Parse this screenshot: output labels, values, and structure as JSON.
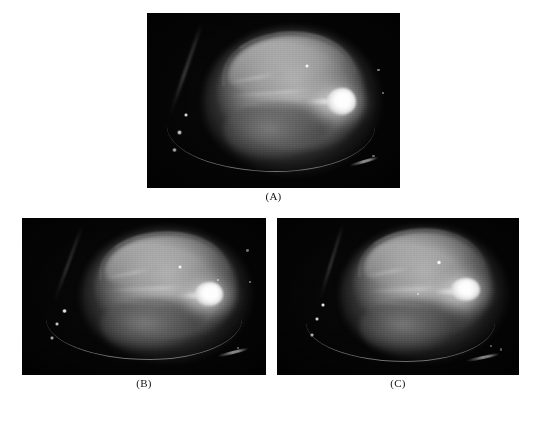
{
  "figure": {
    "background_color": "#ffffff",
    "panel_background_color": "#050505",
    "caption_color": "#141414",
    "panels": [
      {
        "id": "A",
        "caption": "(A)",
        "frame": {
          "x": 147,
          "y": 13,
          "width": 253,
          "height": 175
        },
        "caption_box": {
          "x": 147,
          "y": 190,
          "width": 253,
          "height": 14
        },
        "content": {
          "modality": "grayscale-fluorescence-mouse-image",
          "subject": "mouse",
          "bright_lesion_label": "focal bright signal",
          "fiducial_marker_count": 3,
          "point_source_count": 1
        }
      },
      {
        "id": "B",
        "caption": "(B)",
        "frame": {
          "x": 22,
          "y": 218,
          "width": 244,
          "height": 157
        },
        "caption_box": {
          "x": 22,
          "y": 377,
          "width": 244,
          "height": 14
        },
        "content": {
          "modality": "grayscale-fluorescence-mouse-image",
          "subject": "mouse",
          "bright_lesion_label": "focal bright signal",
          "fiducial_marker_count": 3,
          "point_source_count": 1
        }
      },
      {
        "id": "C",
        "caption": "(C)",
        "frame": {
          "x": 277,
          "y": 218,
          "width": 242,
          "height": 157
        },
        "caption_box": {
          "x": 277,
          "y": 377,
          "width": 242,
          "height": 14
        },
        "content": {
          "modality": "grayscale-fluorescence-mouse-image",
          "subject": "mouse",
          "bright_lesion_label": "focal bright signal",
          "fiducial_marker_count": 3,
          "point_source_count": 1
        }
      }
    ]
  }
}
